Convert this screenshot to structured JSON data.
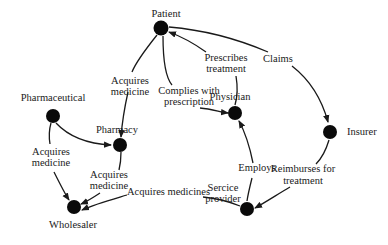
{
  "diagram": {
    "type": "network",
    "nodes": [
      {
        "id": "patient",
        "label": "Patient"
      },
      {
        "id": "pharmaceutical",
        "label": "Pharmaceutical"
      },
      {
        "id": "pharmacy",
        "label": "Pharmacy"
      },
      {
        "id": "physician",
        "label": "Physician"
      },
      {
        "id": "insurer",
        "label": "Insurer"
      },
      {
        "id": "service_provider",
        "label": "Sercice provider"
      },
      {
        "id": "wholesaler",
        "label": "Wholesaler"
      }
    ],
    "edges": [
      {
        "from": "patient",
        "to": "pharmacy",
        "label_line1": "Acquires",
        "label_line2": "medicine"
      },
      {
        "from": "patient",
        "to": "physician",
        "label_line1": "Complies with",
        "label_line2": "prescription"
      },
      {
        "from": "physician",
        "to": "patient",
        "label_line1": "Prescribes",
        "label_line2": "treatment"
      },
      {
        "from": "patient",
        "to": "insurer",
        "label_line1": "Claims"
      },
      {
        "from": "pharmaceutical",
        "to": "pharmacy"
      },
      {
        "from": "pharmaceutical",
        "to": "wholesaler",
        "label_line1": "Acquires",
        "label_line2": "medicine"
      },
      {
        "from": "pharmacy",
        "to": "wholesaler",
        "label_line1": "Acquires",
        "label_line2": "medicine"
      },
      {
        "from": "service_provider",
        "to": "wholesaler",
        "label_line1": "Acquires medicines"
      },
      {
        "from": "service_provider",
        "to": "physician",
        "label_line1": "Employs"
      },
      {
        "from": "insurer",
        "to": "service_provider",
        "label_line1": "Reimburses for",
        "label_line2": "treatment"
      }
    ]
  }
}
